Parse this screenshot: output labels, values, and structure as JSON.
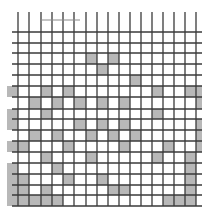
{
  "figure": {
    "colors": {
      "background": "#ffffff",
      "line": "#3a3a3a",
      "shade": "#b8b8b8",
      "top_mark": "#8a8a8a"
    },
    "columns_x": [
      7,
      18,
      29,
      41,
      52,
      63,
      74,
      86,
      97,
      108,
      119,
      130,
      141,
      152,
      163,
      174,
      185,
      196,
      202
    ],
    "rows_y": [
      20,
      32,
      43,
      53,
      64,
      75,
      86,
      97,
      109,
      119,
      130,
      141,
      152,
      163,
      174,
      185,
      195,
      206
    ],
    "vertical_lines_x": [
      18,
      29,
      41,
      52,
      63,
      74,
      86,
      97,
      108,
      119,
      130,
      141,
      152,
      163,
      174,
      185,
      196
    ],
    "vertical_line_span": [
      12,
      206
    ],
    "horizontal_lines_y": [
      32,
      43,
      53,
      64,
      75,
      86,
      97,
      109,
      119,
      130,
      141,
      152,
      163,
      174,
      185,
      195,
      206
    ],
    "horizontal_line_span": [
      12,
      202
    ],
    "top_mark": {
      "x1": 41,
      "x2": 80,
      "y": 20
    },
    "shaded_cells": [
      [
        3,
        7
      ],
      [
        3,
        9
      ],
      [
        4,
        8
      ],
      [
        5,
        11
      ],
      [
        6,
        0
      ],
      [
        6,
        3
      ],
      [
        6,
        5
      ],
      [
        6,
        13
      ],
      [
        6,
        16
      ],
      [
        6,
        17
      ],
      [
        7,
        2
      ],
      [
        7,
        4
      ],
      [
        7,
        6
      ],
      [
        7,
        8
      ],
      [
        7,
        10
      ],
      [
        7,
        17
      ],
      [
        8,
        0
      ],
      [
        8,
        3
      ],
      [
        8,
        13
      ],
      [
        9,
        0
      ],
      [
        9,
        6
      ],
      [
        9,
        8
      ],
      [
        9,
        10
      ],
      [
        9,
        17
      ],
      [
        10,
        2
      ],
      [
        10,
        4
      ],
      [
        10,
        7
      ],
      [
        10,
        9
      ],
      [
        10,
        11
      ],
      [
        10,
        17
      ],
      [
        11,
        0
      ],
      [
        11,
        1
      ],
      [
        11,
        5
      ],
      [
        11,
        10
      ],
      [
        11,
        14
      ],
      [
        11,
        17
      ],
      [
        12,
        3
      ],
      [
        12,
        7
      ],
      [
        12,
        13
      ],
      [
        12,
        16
      ],
      [
        13,
        0
      ],
      [
        13,
        4
      ],
      [
        13,
        16
      ],
      [
        14,
        0
      ],
      [
        14,
        1
      ],
      [
        14,
        5
      ],
      [
        14,
        8
      ],
      [
        14,
        16
      ],
      [
        15,
        0
      ],
      [
        15,
        1
      ],
      [
        15,
        3
      ],
      [
        15,
        9
      ],
      [
        15,
        10
      ],
      [
        15,
        16
      ],
      [
        16,
        0
      ],
      [
        16,
        1
      ],
      [
        16,
        2
      ],
      [
        16,
        3
      ],
      [
        16,
        4
      ],
      [
        16,
        14
      ],
      [
        16,
        15
      ],
      [
        16,
        16
      ]
    ]
  }
}
